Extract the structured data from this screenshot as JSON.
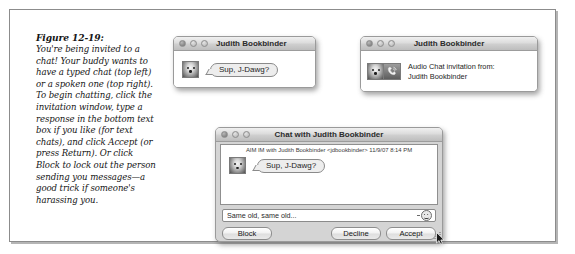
{
  "figure": {
    "caption_title": "Figure 12-19:",
    "caption_body": "You're being invited to a chat! Your buddy wants to have a typed chat (top left) or a spoken one (top right). To begin chatting, click the invitation window, type a response in the bottom text box if you like (for text chats), and click Accept (or press Return). Or click Block to lock out the person sending you messages—a good trick if someone's harassing you."
  },
  "typed_invite_window": {
    "title": "Judith Bookbinder",
    "buddy_icon": "buddy-picture-dog",
    "message": "Sup, J-Dawg?",
    "traffic_lights": [
      "close",
      "minimize",
      "zoom"
    ]
  },
  "audio_invite_window": {
    "title": "Judith Bookbinder",
    "buddy_icon": "buddy-picture-dog",
    "audio_icon": "phone-audio-icon",
    "invite_line1": "Audio Chat invitation from:",
    "invite_line2": "Judith Bookbinder",
    "traffic_lights": [
      "close",
      "minimize",
      "zoom"
    ]
  },
  "chat_window": {
    "title": "Chat with Judith Bookbinder",
    "transcript_header": "AIM IM with Judith Bookbinder <jdbookbinder>  11/9/07 8:14 PM",
    "buddy_icon": "buddy-picture-dog",
    "message": "Sup, J-Dawg?",
    "input_value": "Same old, same old...",
    "input_placeholder": "",
    "smiley_icon": "smiley-face-icon",
    "buttons": {
      "block": "Block",
      "decline": "Decline",
      "accept": "Accept"
    },
    "traffic_lights": [
      "close",
      "minimize",
      "zoom"
    ],
    "cursor": "arrow-pointer"
  },
  "colors": {
    "frame_border": "#8c8c8c",
    "window_border": "#9a9a9a",
    "chat_window_bg": "#d4d4d4",
    "text": "#1d1d1d"
  }
}
